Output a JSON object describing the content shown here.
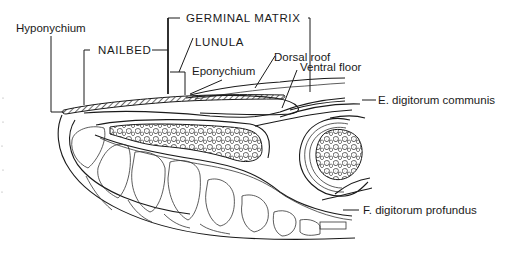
{
  "diagram": {
    "labels": {
      "hyponychium": "Hyponychium",
      "nailbed": "NAILBED",
      "germinal_matrix": "GERMINAL MATRIX",
      "lunula": "LUNULA",
      "eponychium": "Eponychium",
      "dorsal_roof": "Dorsal roof",
      "ventral_floor": "Ventral floor",
      "ext_tendon": "E. digitorum communis",
      "flex_tendon": "F. digitorum profundus"
    },
    "colors": {
      "line": "#1a1a1a",
      "background": "#ffffff"
    }
  }
}
